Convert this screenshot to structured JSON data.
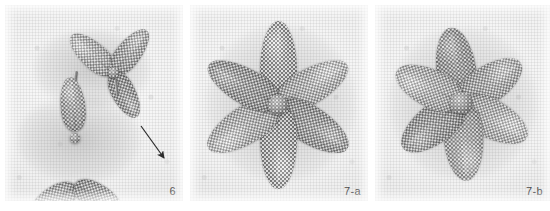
{
  "figure": {
    "background_color": "#ffffff",
    "panel_background": "#efefef",
    "bead_color": "#9a9a9a",
    "label_color": "#4a4a4a",
    "arrow_color": "#2b2b2b",
    "panels": [
      {
        "id": "panel-6",
        "label": "6",
        "subject": "beaded-flower-partial-assembly",
        "petal_count": 6,
        "has_arrow": true,
        "arrow_direction": "down-right"
      },
      {
        "id": "panel-7a",
        "label": "7-a",
        "subject": "beaded-flower-flat-six-petal",
        "petal_count": 6,
        "has_arrow": false,
        "arrow_direction": ""
      },
      {
        "id": "panel-7b",
        "label": "7-b",
        "subject": "beaded-flower-raised-six-petal",
        "petal_count": 6,
        "has_arrow": false,
        "arrow_direction": ""
      }
    ]
  }
}
